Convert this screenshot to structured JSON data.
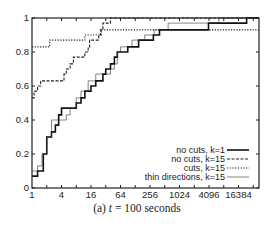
{
  "caption": {
    "prefix": "(a) ",
    "var": "t",
    "rest": " = 100 seconds"
  },
  "chart_data": {
    "type": "line",
    "step": true,
    "title": "(a) t = 100 seconds",
    "xlabel": "",
    "ylabel": "",
    "xscale": "log2",
    "xlim": [
      1,
      40000
    ],
    "ylim": [
      0,
      1
    ],
    "x_ticks": [
      1,
      4,
      16,
      64,
      256,
      1024,
      4096,
      16384
    ],
    "x_tick_labels": [
      "1",
      "4",
      "16",
      "64",
      "256",
      "1024",
      "4096",
      "16384"
    ],
    "y_ticks": [
      0,
      0.2,
      0.4,
      0.6,
      0.8,
      1
    ],
    "y_tick_labels": [
      "0",
      "0.2",
      "0.4",
      "0.6",
      "0.8",
      "1"
    ],
    "grid": false,
    "legend_position": "lower right",
    "series": [
      {
        "name": "no cuts, k=1",
        "style": "solid-thick",
        "points": [
          [
            1,
            0.07
          ],
          [
            1.3,
            0.1
          ],
          [
            1.7,
            0.2
          ],
          [
            2,
            0.3
          ],
          [
            2.5,
            0.33
          ],
          [
            3,
            0.37
          ],
          [
            3.5,
            0.43
          ],
          [
            4,
            0.47
          ],
          [
            6,
            0.47
          ],
          [
            8,
            0.5
          ],
          [
            10,
            0.53
          ],
          [
            12,
            0.57
          ],
          [
            16,
            0.6
          ],
          [
            20,
            0.63
          ],
          [
            28,
            0.67
          ],
          [
            32,
            0.7
          ],
          [
            40,
            0.73
          ],
          [
            48,
            0.77
          ],
          [
            55,
            0.8
          ],
          [
            80,
            0.8
          ],
          [
            90,
            0.83
          ],
          [
            150,
            0.87
          ],
          [
            300,
            0.9
          ],
          [
            400,
            0.93
          ],
          [
            2500,
            0.93
          ],
          [
            4000,
            0.97
          ],
          [
            20000,
            0.97
          ],
          [
            24000,
            1.0
          ]
        ]
      },
      {
        "name": "no cuts, k=15",
        "style": "dashed",
        "points": [
          [
            1,
            0.53
          ],
          [
            1.1,
            0.57
          ],
          [
            1.3,
            0.6
          ],
          [
            1.5,
            0.63
          ],
          [
            4,
            0.63
          ],
          [
            4.5,
            0.67
          ],
          [
            5,
            0.7
          ],
          [
            6,
            0.73
          ],
          [
            7,
            0.77
          ],
          [
            10,
            0.77
          ],
          [
            12,
            0.8
          ],
          [
            14,
            0.83
          ],
          [
            15,
            0.87
          ],
          [
            20,
            0.87
          ],
          [
            23,
            0.9
          ],
          [
            25,
            0.93
          ],
          [
            28,
            0.97
          ],
          [
            40,
            0.97
          ],
          [
            40,
            1.0
          ]
        ]
      },
      {
        "name": "cuts, k=15",
        "style": "dotted",
        "points": [
          [
            1,
            0.83
          ],
          [
            2,
            0.83
          ],
          [
            2.3,
            0.87
          ],
          [
            11,
            0.87
          ],
          [
            12,
            0.9
          ],
          [
            25,
            0.9
          ],
          [
            26,
            0.93
          ],
          [
            40000,
            0.93
          ]
        ]
      },
      {
        "name": "thin directions, k=15",
        "style": "thin",
        "points": [
          [
            1,
            0.1
          ],
          [
            1.3,
            0.13
          ],
          [
            1.6,
            0.2
          ],
          [
            2,
            0.3
          ],
          [
            2.5,
            0.4
          ],
          [
            4,
            0.4
          ],
          [
            5,
            0.43
          ],
          [
            6,
            0.47
          ],
          [
            8,
            0.53
          ],
          [
            10,
            0.57
          ],
          [
            14,
            0.63
          ],
          [
            20,
            0.67
          ],
          [
            32,
            0.67
          ],
          [
            40,
            0.7
          ],
          [
            48,
            0.73
          ],
          [
            55,
            0.8
          ],
          [
            64,
            0.83
          ],
          [
            90,
            0.83
          ],
          [
            110,
            0.87
          ],
          [
            200,
            0.9
          ],
          [
            280,
            0.9
          ],
          [
            310,
            0.93
          ],
          [
            600,
            0.97
          ],
          [
            6000,
            0.97
          ],
          [
            6500,
            1.0
          ]
        ]
      }
    ]
  }
}
